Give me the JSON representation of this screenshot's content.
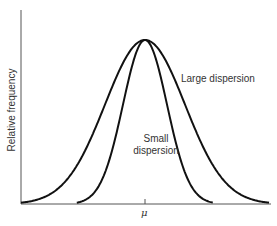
{
  "chart_data": {
    "type": "line",
    "title": "",
    "xlabel": "",
    "ylabel": "Relative frequency",
    "x_ticks": [
      "μ"
    ],
    "grid": false,
    "legend": null,
    "annotations": [
      "Large dispersion",
      "Small dispersion"
    ],
    "series": [
      {
        "name": "Large dispersion",
        "shape": "normal",
        "mean": "μ",
        "relative_sd": 1.0,
        "peak_height": 1.0
      },
      {
        "name": "Small dispersion",
        "shape": "normal",
        "mean": "μ",
        "relative_sd": 0.55,
        "peak_height": 1.0
      }
    ]
  },
  "labels": {
    "ylabel": "Relative frequency",
    "large": "Large dispersion",
    "small_line1": "Small",
    "small_line2": "dispersion",
    "mu": "μ"
  }
}
